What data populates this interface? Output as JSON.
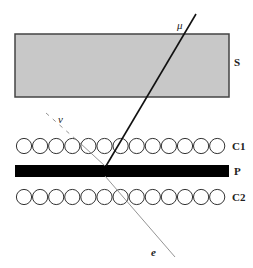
{
  "diagram": {
    "labels": {
      "scintillator": "S",
      "counter_row_1": "C1",
      "plate": "P",
      "counter_row_2": "C2",
      "muon": "μ",
      "neutrino": "ν",
      "electron": "e"
    },
    "counter_rows": [
      {
        "name": "C1",
        "circle_count": 13
      },
      {
        "name": "C2",
        "circle_count": 13
      }
    ],
    "colors": {
      "scintillator_fill": "#c8c8c8",
      "scintillator_stroke": "#444444",
      "plate_fill": "#000000",
      "circle_stroke": "#333333",
      "muon_track": "#111111",
      "neutrino_electron_track": "#888888"
    }
  }
}
